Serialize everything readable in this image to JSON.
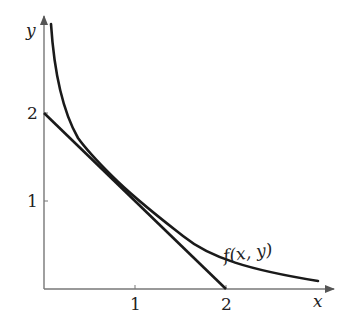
{
  "diagram": {
    "x_axis": {
      "label": "x",
      "ticks": [
        {
          "value": 1,
          "label": "1"
        },
        {
          "value": 2,
          "label": "2"
        }
      ]
    },
    "y_axis": {
      "label": "y",
      "ticks": [
        {
          "value": 1,
          "label": "1"
        },
        {
          "value": 2,
          "label": "2"
        }
      ]
    },
    "curve": {
      "label": "f(x, y)"
    },
    "line": {
      "description": "straight line from (0,2) to (2,0)"
    },
    "colors": {
      "axis": "#777777",
      "curve": "#1a1a1a",
      "line": "#1a1a1a",
      "text": "#222222"
    }
  }
}
